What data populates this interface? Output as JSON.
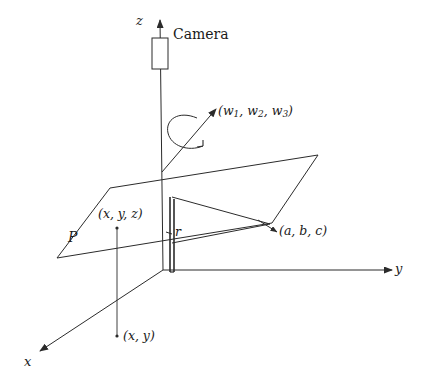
{
  "figure": {
    "type": "3d-geometry-diagram",
    "background_color": "#ffffff",
    "stroke_color": "#2b2b2b"
  },
  "axes": {
    "z_label": "z",
    "x_label": "x",
    "y_label": "y"
  },
  "labels": {
    "camera": "Camera",
    "omega_open": "(",
    "omega_w": "w",
    "omega_sub1": "1",
    "omega_comma1": ", ",
    "omega_sub2": "2",
    "omega_comma2": ", ",
    "omega_sub3": "3",
    "omega_close": ")",
    "omega_full": "(w1, w2, w3)",
    "point_xyz": "(x, y, z)",
    "point_xy": "(x, y)",
    "point_abc": "(a, b, c)",
    "plane_p": "P",
    "radius_r": "r"
  },
  "geometry": {
    "origin": {
      "x": 163,
      "y": 270
    },
    "camera_box": {
      "x": 152,
      "y": 38,
      "width": 16,
      "height": 31
    },
    "z_axis": {
      "x1": 160,
      "y1": 16,
      "x2": 163,
      "y2": 270
    },
    "y_axis": {
      "x1": 163,
      "y1": 270,
      "x2": 400,
      "y2": 270
    },
    "x_axis": {
      "x1": 163,
      "y1": 270,
      "x2": 34,
      "y2": 355
    },
    "plane_vertices": [
      {
        "x": 110,
        "y": 188
      },
      {
        "x": 318,
        "y": 155
      },
      {
        "x": 272,
        "y": 223
      },
      {
        "x": 57,
        "y": 258
      }
    ],
    "pole": {
      "x": 171,
      "y_top": 197,
      "y_bottom": 272,
      "width": 4
    },
    "omega_arrow": {
      "x1": 166,
      "y1": 166,
      "x2": 215,
      "y2": 110
    }
  }
}
